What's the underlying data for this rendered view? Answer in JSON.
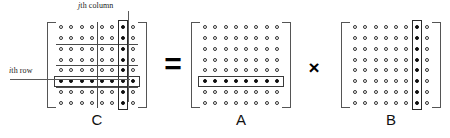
{
  "figure": {
    "background": "#ffffff"
  },
  "colors": {
    "dot_outline": "#333333",
    "dot_filled": "#111111",
    "bracket": "#555555",
    "gridline": "#4a4a4a",
    "highlight_box": "#2a2a2a",
    "leader_line": "#5a5a5a",
    "text": "#1a1a1a"
  },
  "callouts": {
    "column": {
      "index_symbol": "j",
      "text": "th column",
      "full": "jth column"
    },
    "row": {
      "index_symbol": "i",
      "text": "th row",
      "full": "ith row"
    }
  },
  "operators": {
    "equals": "=",
    "times": "×"
  },
  "matrices": [
    {
      "id": "C",
      "label": "C",
      "rows": 8,
      "cols": 8,
      "highlight_row_index": 6,
      "highlight_col_index": 7,
      "block_grid": {
        "row_divisions": [
          2,
          4,
          6
        ],
        "col_divisions": [
          4
        ]
      },
      "description": "Result matrix with ith row and jth column intersection highlighted"
    },
    {
      "id": "A",
      "label": "A",
      "rows": 8,
      "cols": 8,
      "highlight_row_index": 6,
      "highlight_col_index": null,
      "description": "Left operand matrix with ith row highlighted"
    },
    {
      "id": "B",
      "label": "B",
      "rows": 8,
      "cols": 8,
      "highlight_row_index": null,
      "highlight_col_index": 7,
      "description": "Right operand matrix with jth column highlighted"
    }
  ]
}
